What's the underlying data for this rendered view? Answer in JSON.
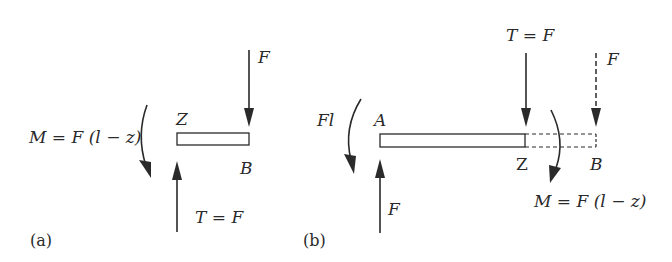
{
  "panel_a": {
    "tag": "(a)",
    "force_top": "F",
    "section_label": "Z",
    "end_label": "B",
    "moment_label": "M = F (l − z)",
    "shear_label": "T = F"
  },
  "panel_b": {
    "tag": "(b)",
    "reaction_moment": "Fl",
    "support_label": "A",
    "reaction_force": "F",
    "shear_label": "T = F",
    "removed_force": "F",
    "section_label": "Z",
    "end_label": "B",
    "moment_label": "M = F (l − z)"
  },
  "colors": {
    "stroke": "#2a2a2a",
    "background": "#ffffff"
  }
}
